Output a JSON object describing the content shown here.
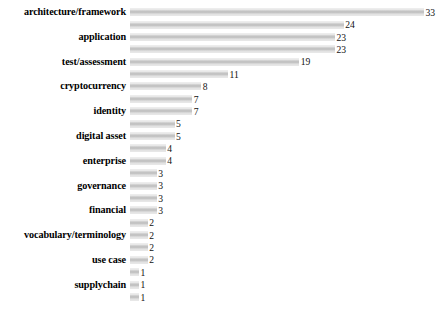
{
  "chart_data": {
    "type": "bar",
    "orientation": "horizontal",
    "title": "",
    "subtitle": "",
    "xlabel": "",
    "ylabel": "",
    "grid": false,
    "legend": null,
    "legend_position": "none",
    "xlim": [
      0,
      33
    ],
    "value_labels_shown": true,
    "axis_lines_shown": false,
    "tick_labels_shown": false,
    "bar_color": "#c9c9c9",
    "label_color": "#000000",
    "background_color": "#ffffff",
    "note": "Category labels are printed on alternating rows only; unlabeled rows share the axis with the labeled neighbour above.",
    "categories": [
      "architecture/framework",
      "",
      "application",
      "",
      "test/assessment",
      "",
      "cryptocurrency",
      "",
      "identity",
      "",
      "digital asset",
      "",
      "enterprise",
      "",
      "governance",
      "",
      "financial",
      "",
      "vocabulary/terminology",
      "",
      "use case",
      "",
      "supplychain",
      ""
    ],
    "values": [
      33,
      24,
      23,
      23,
      19,
      11,
      8,
      7,
      7,
      5,
      5,
      4,
      4,
      3,
      3,
      3,
      3,
      2,
      2,
      2,
      2,
      1,
      1,
      1
    ],
    "labeled_categories": [
      "architecture/framework",
      "application",
      "test/assessment",
      "cryptocurrency",
      "identity",
      "digital asset",
      "enterprise",
      "governance",
      "financial",
      "vocabulary/terminology",
      "use case",
      "supplychain"
    ]
  }
}
